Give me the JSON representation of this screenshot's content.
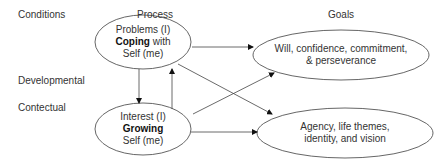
{
  "headers": {
    "conditions": "Conditions",
    "process": "Process",
    "goals": "Goals"
  },
  "side_labels": {
    "developmental": "Developmental",
    "contectual": "Contectual"
  },
  "nodes": {
    "coping": {
      "line1": "Problems (I)",
      "bold": "Coping",
      "rest": " with",
      "line3": "Self (me)"
    },
    "growing": {
      "line1": "Interest (I)",
      "bold": "Growing",
      "line3": "Self (me)"
    },
    "will": {
      "line1": "Will, confidence, commitment,",
      "line2": "& perseverance"
    },
    "agency": {
      "line1": "Agency, life themes,",
      "line2": "identity, and vision"
    }
  },
  "edges": [
    {
      "from": "coping",
      "to": "will"
    },
    {
      "from": "coping",
      "to": "agency"
    },
    {
      "from": "coping",
      "to": "growing"
    },
    {
      "from": "growing",
      "to": "coping"
    },
    {
      "from": "growing",
      "to": "will"
    },
    {
      "from": "growing",
      "to": "agency"
    }
  ]
}
